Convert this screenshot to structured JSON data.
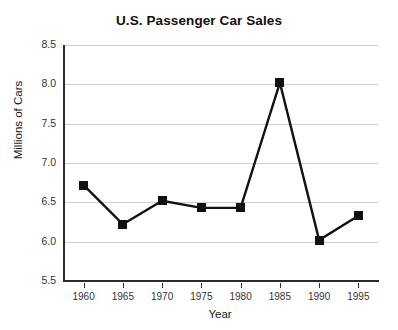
{
  "chart_data": {
    "type": "line",
    "title": "U.S. Passenger Car Sales",
    "xlabel": "Year",
    "ylabel": "Millions of Cars",
    "categories": [
      "1960",
      "1965",
      "1970",
      "1975",
      "1980",
      "1985",
      "1990",
      "1995"
    ],
    "x": [
      1960,
      1965,
      1970,
      1975,
      1980,
      1985,
      1990,
      1995
    ],
    "values": [
      6.72,
      6.22,
      6.52,
      6.43,
      6.43,
      8.02,
      6.02,
      6.33
    ],
    "series": [
      {
        "name": "U.S. Passenger Car Sales",
        "values": [
          6.72,
          6.22,
          6.52,
          6.43,
          6.43,
          8.02,
          6.02,
          6.33
        ]
      }
    ],
    "ylim": [
      5.5,
      8.5
    ],
    "xlim": [
      1957.5,
      1997.5
    ],
    "ytick_labels": [
      "8.5",
      "8.0",
      "7.5",
      "7.0",
      "6.5",
      "6.0",
      "5.5"
    ],
    "ytick_values": [
      8.5,
      8.0,
      7.5,
      7.0,
      6.5,
      6.0,
      5.5
    ],
    "xtick_labels": [
      "1960",
      "1965",
      "1970",
      "1975",
      "1980",
      "1985",
      "1990",
      "1995"
    ],
    "grid": "horizontal",
    "legend": "none",
    "marker": "square",
    "line_color": "#111111",
    "marker_color": "#111111",
    "grid_color": "#cfcfcf",
    "axis_color": "#2b2b2b",
    "background": "#ffffff"
  }
}
